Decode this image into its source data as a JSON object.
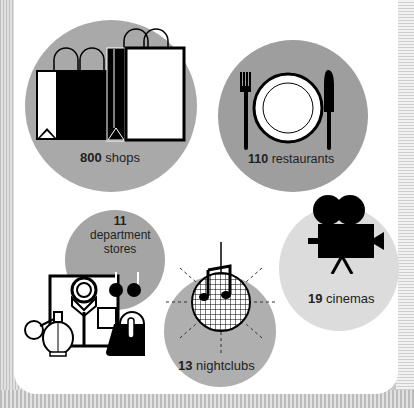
{
  "infographic": {
    "items": [
      {
        "id": "shops",
        "count": "800",
        "label": "shops",
        "icon": "shopping-bags-icon",
        "circle_color": "#a9a9a9"
      },
      {
        "id": "restaurants",
        "count": "110",
        "label": "restaurants",
        "icon": "plate-fork-knife-icon",
        "circle_color": "#9e9e9e"
      },
      {
        "id": "department-stores",
        "count": "11",
        "label": "department stores",
        "icon": "shirt-perfume-handbag-icon",
        "circle_color": "#a5a5a5"
      },
      {
        "id": "nightclubs",
        "count": "13",
        "label": "nightclubs",
        "icon": "disco-ball-music-note-icon",
        "circle_color": "#afafaf"
      },
      {
        "id": "cinemas",
        "count": "19",
        "label": "cinemas",
        "icon": "film-camera-icon",
        "circle_color": "#dcdcdc"
      }
    ]
  }
}
